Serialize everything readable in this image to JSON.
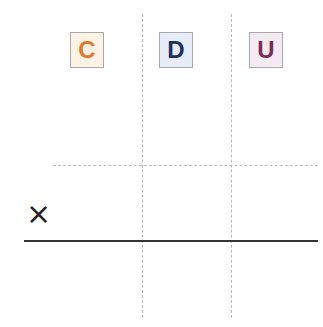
{
  "place_value_headers": [
    {
      "label": "C",
      "text_color": "#e8762a",
      "bg_color": "#fdf3e4"
    },
    {
      "label": "D",
      "text_color": "#1d3160",
      "bg_color": "#e6edf8"
    },
    {
      "label": "U",
      "text_color": "#7a2c55",
      "bg_color": "#f4eaf1"
    }
  ],
  "operator": "×"
}
